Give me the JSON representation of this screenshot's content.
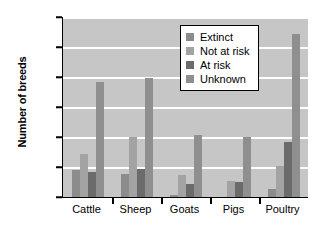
{
  "chart_data": {
    "type": "bar",
    "title": "",
    "xlabel": "",
    "ylabel": "Number of breeds",
    "ylim": [
      0,
      1200
    ],
    "ytick_labels": [
      "0",
      "200",
      "400",
      "600",
      "800",
      "1,000",
      "1,200"
    ],
    "ytick_values": [
      0,
      200,
      400,
      600,
      800,
      1000,
      1200
    ],
    "grid": true,
    "legend_position": "upper-center-right",
    "categories": [
      "Cattle",
      "Sheep",
      "Goats",
      "Pigs",
      "Poultry"
    ],
    "series": [
      {
        "name": "Extinct",
        "color": "#8c8c8c",
        "values": [
          180,
          155,
          15,
          0,
          55
        ]
      },
      {
        "name": "Not at risk",
        "color": "#a3a3a3",
        "values": [
          290,
          400,
          150,
          105,
          205
        ]
      },
      {
        "name": "At risk",
        "color": "#6b6b6b",
        "values": [
          170,
          185,
          90,
          100,
          365
        ]
      },
      {
        "name": "Unknown",
        "color": "#8f8f8f",
        "values": [
          770,
          795,
          415,
          400,
          1090
        ]
      }
    ],
    "plot_background": "#c6c6c6",
    "gridline_color": "#ffffff",
    "axis_color": "#000000"
  }
}
